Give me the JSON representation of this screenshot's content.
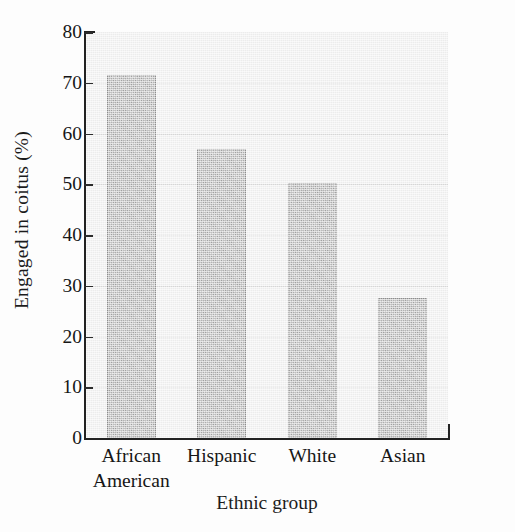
{
  "chart_data": {
    "type": "bar",
    "title": "",
    "subtitle": "",
    "xlabel": "Ethnic group",
    "ylabel": "Engaged in coitus (%)",
    "categories": [
      "African\nAmerican",
      "Hispanic",
      "White",
      "Asian"
    ],
    "category_labels_flat": [
      "African American",
      "Hispanic",
      "White",
      "Asian"
    ],
    "values": [
      71.5,
      57,
      50.2,
      27.5
    ],
    "ylim": [
      0,
      80
    ],
    "yticks": [
      0,
      10,
      20,
      30,
      40,
      50,
      60,
      70,
      80
    ],
    "ytick_labels": [
      "0",
      "10",
      "20",
      "30",
      "40",
      "50",
      "60",
      "70",
      "80"
    ],
    "grid": true,
    "grid_axis": "y",
    "legend": false,
    "legend_position": "none",
    "colors": {
      "bar_fill": "#a9a9a9",
      "bar_edge": "#8d8d8d",
      "plot_background": "#ececec",
      "gridline": "#d6d6d6",
      "axis": "#222222",
      "text": "#161616"
    }
  }
}
